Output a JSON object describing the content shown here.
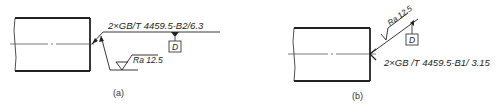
{
  "figure_a": {
    "caption": "(a)",
    "callout": "2×GB/T 4459.5-B2/6.3",
    "roughness": "Ra 12.5",
    "datum": "D"
  },
  "figure_b": {
    "caption": "(b)",
    "callout": "2×GB /T 4459.5-B1/ 3.15",
    "roughness": "Ra 12.5",
    "datum": "D"
  },
  "colors": {
    "line": "#222222",
    "background": "#ffffff"
  }
}
